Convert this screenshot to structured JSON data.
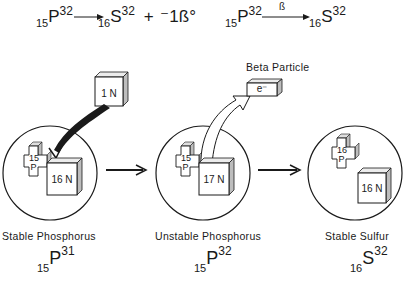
{
  "equations": {
    "full": {
      "reactant_z": "15",
      "reactant_symbol": "P",
      "reactant_a": "32",
      "product_z": "16",
      "product_symbol": "S",
      "product_a": "32",
      "plus": "+",
      "emitted": "⁻1ß°"
    },
    "short": {
      "reactant_z": "15",
      "reactant_symbol": "P",
      "reactant_a": "32",
      "arrow_label": "ß",
      "product_z": "16",
      "product_symbol": "S",
      "product_a": "32"
    }
  },
  "incoming_neutron": {
    "label": "1 N"
  },
  "beta_particle": {
    "title": "Beta Particle",
    "label": "e⁻"
  },
  "nuclei": [
    {
      "name": "Stable Phosphorus",
      "proton_count": "15",
      "proton_symbol": "P",
      "neutron_label": "16 N",
      "iso_z": "15",
      "iso_symbol": "P",
      "iso_a": "31"
    },
    {
      "name": "Unstable Phosphorus",
      "proton_count": "15",
      "proton_symbol": "P",
      "neutron_label": "17 N",
      "iso_z": "15",
      "iso_symbol": "P",
      "iso_a": "32"
    },
    {
      "name": "Stable Sulfur",
      "proton_count": "16",
      "proton_symbol": "P",
      "neutron_label": "16 N",
      "iso_z": "16",
      "iso_symbol": "S",
      "iso_a": "32"
    }
  ],
  "colors": {
    "ink": "#1a1a1a",
    "background": "#ffffff",
    "shade": "#cfcfcf"
  }
}
